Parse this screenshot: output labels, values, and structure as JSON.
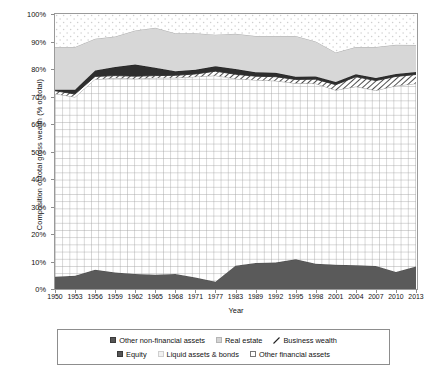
{
  "chart_data": {
    "type": "area",
    "title": "",
    "xlabel": "Year",
    "ylabel": "Composition of total gross wealth (% of total)",
    "ylim": [
      0,
      100
    ],
    "ytick_labels": [
      "0%",
      "10%",
      "20%",
      "30%",
      "40%",
      "50%",
      "60%",
      "70%",
      "80%",
      "90%",
      "100%"
    ],
    "ytick_values": [
      0,
      10,
      20,
      30,
      40,
      50,
      60,
      70,
      80,
      90,
      100
    ],
    "grid": true,
    "stacked": true,
    "legend_position": "bottom",
    "categories": [
      1950,
      1953,
      1956,
      1959,
      1962,
      1965,
      1968,
      1971,
      1977,
      1983,
      1989,
      1992,
      1995,
      1998,
      2001,
      2004,
      2007,
      2010,
      2013
    ],
    "x_tick_labels": [
      "1950",
      "1953",
      "1956",
      "1959",
      "1962",
      "1965",
      "1968",
      "1971",
      "1977",
      "1983",
      "1989",
      "1992",
      "1995",
      "1998",
      "2001",
      "2004",
      "2007",
      "2010",
      "2013"
    ],
    "series": [
      {
        "name": "Equity",
        "fill": "#5a5a5a",
        "pattern": "solid-dark",
        "values": [
          4.5,
          4.8,
          7.0,
          6.0,
          5.5,
          5.2,
          5.5,
          4.2,
          2.6,
          8.5,
          9.5,
          9.6,
          10.8,
          9.2,
          8.8,
          8.6,
          8.4,
          6.2,
          8.2
        ]
      },
      {
        "name": "Liquid assets & bonds",
        "fill": "#ffffff",
        "pattern": "fine-grid",
        "values": [
          66.5,
          65.0,
          69.3,
          70.7,
          71.0,
          71.6,
          71.3,
          73.0,
          75.0,
          68.0,
          66.5,
          66.1,
          64.0,
          65.5,
          63.5,
          65.0,
          63.8,
          67.7,
          66.5
        ]
      },
      {
        "name": "Business wealth",
        "fill": "#ffffff",
        "pattern": "diagonal-hatch",
        "values": [
          1.1,
          1.1,
          1.0,
          0.9,
          0.9,
          0.8,
          0.9,
          1.0,
          1.6,
          1.6,
          1.4,
          1.5,
          1.4,
          1.6,
          2.0,
          3.6,
          3.6,
          3.4,
          3.3
        ]
      },
      {
        "name": "Other non-financial assets",
        "fill": "#333333",
        "pattern": "solid-dark",
        "values": [
          0.4,
          1.6,
          2.2,
          3.1,
          4.2,
          2.9,
          1.5,
          1.5,
          1.8,
          1.9,
          1.4,
          1.4,
          1.0,
          1.0,
          1.0,
          0.9,
          0.9,
          0.9,
          0.9
        ]
      },
      {
        "name": "Real estate",
        "fill": "#d7d7d7",
        "pattern": "solid-light",
        "values": [
          15.5,
          15.5,
          11.5,
          11.1,
          12.4,
          14.5,
          13.8,
          13.3,
          11.5,
          12.8,
          13.2,
          13.4,
          14.8,
          12.7,
          10.7,
          9.9,
          11.3,
          10.6,
          9.8
        ]
      },
      {
        "name": "Other financial assets",
        "fill": "#ffffff",
        "pattern": "dotted",
        "values": [
          12.0,
          12.0,
          9.0,
          8.2,
          5.0,
          5.0,
          7.0,
          7.0,
          7.5,
          7.2,
          8.0,
          8.0,
          7.0,
          10.0,
          14.0,
          12.0,
          12.0,
          11.2,
          11.3
        ]
      }
    ],
    "cumulative_boundaries_pct": {
      "comment": "top edge of each stacked band, bottom-to-top",
      "equity_top": [
        4.5,
        4.8,
        7.0,
        6.0,
        5.5,
        5.2,
        5.5,
        4.2,
        2.6,
        8.5,
        9.5,
        9.6,
        10.8,
        9.2,
        8.8,
        8.6,
        8.4,
        6.2,
        8.2
      ],
      "liquid_top": [
        71.0,
        69.8,
        76.3,
        76.7,
        76.5,
        76.8,
        76.8,
        77.2,
        77.6,
        76.5,
        76.0,
        75.7,
        74.8,
        74.7,
        72.3,
        73.6,
        72.2,
        73.9,
        74.7
      ],
      "business_top": [
        72.1,
        70.9,
        77.3,
        77.6,
        77.4,
        77.6,
        77.7,
        78.2,
        79.2,
        78.1,
        77.4,
        77.2,
        76.2,
        76.3,
        74.3,
        77.2,
        75.8,
        77.3,
        78.0
      ],
      "othernonfin_top": [
        72.5,
        72.5,
        79.5,
        80.7,
        81.6,
        80.5,
        79.2,
        79.7,
        81.0,
        80.0,
        78.8,
        78.6,
        77.2,
        77.3,
        75.3,
        78.1,
        76.7,
        78.2,
        78.9
      ],
      "realestate_top": [
        88.0,
        88.0,
        91.0,
        91.8,
        94.0,
        95.0,
        93.0,
        93.0,
        92.5,
        92.8,
        92.0,
        92.0,
        92.0,
        90.0,
        86.0,
        88.0,
        88.0,
        88.8,
        88.7
      ],
      "total_top": [
        100,
        100,
        100,
        100,
        100,
        100,
        100,
        100,
        100,
        100,
        100,
        100,
        100,
        100,
        100,
        100,
        100,
        100,
        100
      ]
    }
  },
  "legend": {
    "row1": [
      {
        "label": "Other non-financial assets",
        "swatch": "dark-square"
      },
      {
        "label": "Real estate",
        "swatch": "grey-square"
      },
      {
        "label": "Business wealth",
        "swatch": "hatch-square"
      }
    ],
    "row2": [
      {
        "label": "Equity",
        "swatch": "dark-square"
      },
      {
        "label": "Liquid assets & bonds",
        "swatch": "light-square"
      },
      {
        "label": "Other financial assets",
        "swatch": "white-square"
      }
    ]
  },
  "colors": {
    "equity": "#5a5a5a",
    "other_non_financial": "#333333",
    "real_estate": "#d7d7d7",
    "frame": "#9a9a9a",
    "text": "#111111"
  }
}
